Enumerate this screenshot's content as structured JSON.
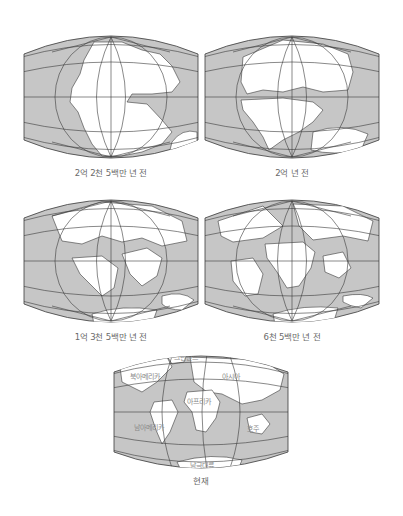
{
  "figure": {
    "colors": {
      "ocean": "#c6c6c6",
      "land": "#ffffff",
      "grid": "#3a3a3a",
      "caption": "#6a6a6a"
    },
    "maps": [
      {
        "id": "map-225ma",
        "caption": "2억 2천 5백만 년 전"
      },
      {
        "id": "map-200ma",
        "caption": "2억 년 전"
      },
      {
        "id": "map-135ma",
        "caption": "1억 3천 5백만 년 전"
      },
      {
        "id": "map-65ma",
        "caption": "6천 5백만 년 전"
      },
      {
        "id": "map-present",
        "caption": "현재",
        "labels": {
          "greenland": "그린란드",
          "north_america": "북아메리카",
          "asia": "아시아",
          "africa": "아프리카",
          "south_america": "남아메리카",
          "australia": "호주",
          "antarctica": "남극대륙"
        }
      }
    ]
  }
}
